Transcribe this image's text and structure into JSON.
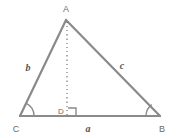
{
  "figure": {
    "type": "geometry-diagram",
    "colors": {
      "stroke": "#8a8a8a",
      "label": "#6b6b6b",
      "side_label": "#555555",
      "background": "#ffffff"
    },
    "vertices": [
      {
        "id": "A",
        "label": "A",
        "x": 66,
        "y": 20
      },
      {
        "id": "B",
        "label": "B",
        "x": 160,
        "y": 116
      },
      {
        "id": "C",
        "label": "C",
        "x": 20,
        "y": 116
      },
      {
        "id": "D",
        "label": "D",
        "x": 67,
        "y": 116
      }
    ],
    "sides": [
      {
        "id": "a",
        "label": "a",
        "from": "C",
        "to": "B",
        "label_x": 88,
        "label_y": 131
      },
      {
        "id": "b",
        "label": "b",
        "from": "C",
        "to": "A",
        "label_x": 28,
        "label_y": 71
      },
      {
        "id": "c",
        "label": "c",
        "from": "A",
        "to": "B",
        "label_x": 122,
        "label_y": 69
      }
    ],
    "altitude": {
      "from": "A",
      "to": "D",
      "style": "dotted",
      "right_angle_at": "D"
    },
    "angle_marks": [
      {
        "at": "C",
        "type": "arc"
      },
      {
        "at": "B",
        "type": "arc"
      }
    ]
  }
}
